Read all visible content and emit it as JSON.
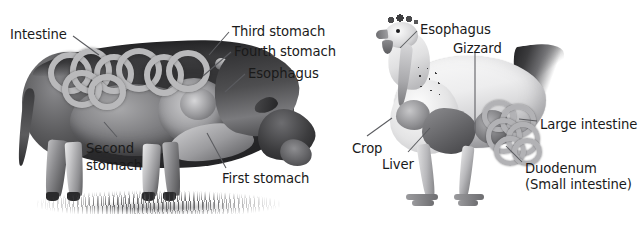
{
  "figure": {
    "background_color": "#ffffff",
    "label_color": "#1a1a1a",
    "leader_line_color": "#5a5b5f",
    "width": 642,
    "height": 228
  },
  "cow": {
    "name": "cow-digestive-diagram",
    "caption": "Cow (ruminant) digestive system",
    "labels": [
      {
        "id": "intestine",
        "text": "Intestine",
        "x": 10,
        "y": 27
      },
      {
        "id": "third-stomach",
        "text": "Third stomach",
        "x": 232,
        "y": 24
      },
      {
        "id": "fourth-stomach",
        "text": "Fourth stomach",
        "x": 234,
        "y": 44
      },
      {
        "id": "esophagus",
        "text": "Esophagus",
        "x": 248,
        "y": 66
      },
      {
        "id": "second-stomach",
        "text": "Second stomach",
        "x": 86,
        "y": 140,
        "lines": [
          "Second",
          "stomach"
        ]
      },
      {
        "id": "first-stomach",
        "text": "First stomach",
        "x": 222,
        "y": 171
      }
    ]
  },
  "chicken": {
    "name": "chicken-digestive-diagram",
    "caption": "Chicken (poultry) digestive system",
    "labels": [
      {
        "id": "esophagus",
        "text": "Esophagus",
        "x": 420,
        "y": 22
      },
      {
        "id": "gizzard",
        "text": "Gizzard",
        "x": 453,
        "y": 41
      },
      {
        "id": "large-intestine",
        "text": "Large intestine",
        "x": 540,
        "y": 117
      },
      {
        "id": "crop",
        "text": "Crop",
        "x": 352,
        "y": 141
      },
      {
        "id": "liver",
        "text": "Liver",
        "x": 382,
        "y": 157
      },
      {
        "id": "duodenum",
        "text": "Duodenum",
        "x": 525,
        "y": 161
      },
      {
        "id": "small-intestine",
        "text": "(Small intestine)",
        "x": 525,
        "y": 177
      }
    ]
  }
}
